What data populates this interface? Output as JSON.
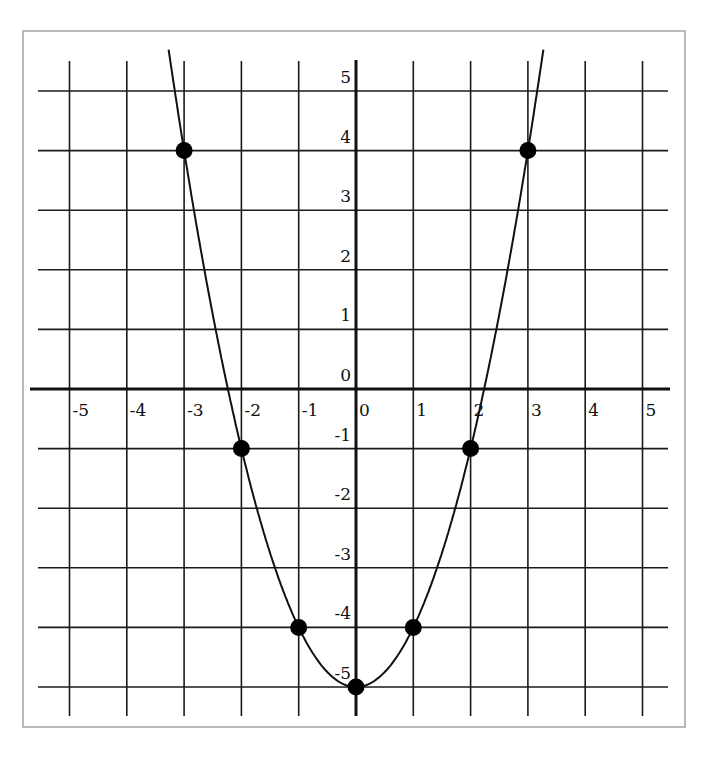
{
  "chart_data": {
    "type": "scatter",
    "title": "",
    "xlabel": "",
    "ylabel": "",
    "xlim": [
      -5,
      5
    ],
    "ylim": [
      -5,
      5
    ],
    "grid": true,
    "legend": null,
    "x_ticks": [
      "-5",
      "-4",
      "-3",
      "-2",
      "-1",
      "0",
      "1",
      "2",
      "3",
      "4",
      "5"
    ],
    "y_ticks": [
      "5",
      "4",
      "3",
      "2",
      "1",
      "0",
      "-1",
      "-2",
      "-3",
      "-4",
      "-5"
    ],
    "curve": "y = x^2 - 5",
    "series": [
      {
        "name": "points",
        "x": [
          -3,
          -2,
          -1,
          0,
          1,
          2,
          3
        ],
        "y": [
          4,
          -1,
          -4,
          -5,
          -4,
          -1,
          4
        ]
      }
    ]
  },
  "colors": {
    "grid": "#1a1a1a",
    "axis": "#111111",
    "curve": "#111111",
    "points": "#000000",
    "frame": "#b9b9b9"
  }
}
